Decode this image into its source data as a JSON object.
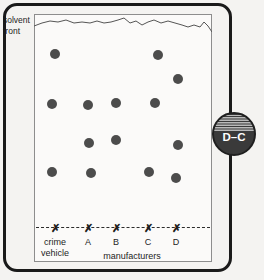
{
  "figure": {
    "background_color": "#f4f3f1",
    "frame_color": "#1a1a1a",
    "plate_fill": "#fbfaf9",
    "plate_border": "#8d8d8d",
    "spot_color": "#4c4c4c",
    "baseline_color": "#2b2b2b"
  },
  "solvent_front": {
    "label_line1": "solvent",
    "label_line2": "front",
    "path": "M 0 12 L 8 9 L 16 7 L 24 8 L 32 6 L 40 9 L 48 8 L 56 9 L 63 7 L 70 9 L 77 8 L 84 6 L 90 4 L 96 9 L 102 7 L 108 11 L 114 8 L 120 6 L 127 9 L 134 7 L 141 9 L 148 11 L 154 13 L 160 11 L 166 13 L 170 8 L 174 12 L 178 18"
  },
  "lanes": [
    {
      "id": "lane-crime-vehicle",
      "x": 55,
      "marker": "✗",
      "label_line1": "crime",
      "label_line2": "vehicle"
    },
    {
      "id": "lane-a",
      "x": 88,
      "marker": "✗",
      "label_line1": "A",
      "label_line2": ""
    },
    {
      "id": "lane-b",
      "x": 116,
      "marker": "✗",
      "label_line1": "B",
      "label_line2": ""
    },
    {
      "id": "lane-c",
      "x": 148,
      "marker": "✗",
      "label_line1": "C",
      "label_line2": ""
    },
    {
      "id": "lane-d",
      "x": 176,
      "marker": "✗",
      "label_line1": "D",
      "label_line2": ""
    }
  ],
  "group_label": "manufacturers",
  "badge": {
    "text": "D–C",
    "fill_color": "#3a3a3a",
    "stripe_color": "#d8d8d8",
    "text_color": "#ffffff"
  },
  "chart_data": {
    "type": "scatter",
    "xlabel": "manufacturers",
    "ylabel": "",
    "grid": false,
    "legend": "none",
    "axis_note": "Vertical position = distance travelled from baseline toward solvent front",
    "baseline_y": 228,
    "solvent_front_y": 26,
    "categories": [
      "crime vehicle",
      "A",
      "B",
      "C",
      "D"
    ],
    "spots": [
      {
        "lane": "crime vehicle",
        "x": 55,
        "y": 54
      },
      {
        "lane": "crime vehicle",
        "x": 52,
        "y": 104
      },
      {
        "lane": "crime vehicle",
        "x": 52,
        "y": 172
      },
      {
        "lane": "A",
        "x": 88,
        "y": 105
      },
      {
        "lane": "A",
        "x": 89,
        "y": 143
      },
      {
        "lane": "A",
        "x": 91,
        "y": 173
      },
      {
        "lane": "B",
        "x": 116,
        "y": 103
      },
      {
        "lane": "B",
        "x": 116,
        "y": 140
      },
      {
        "lane": "C",
        "x": 155,
        "y": 103
      },
      {
        "lane": "C",
        "x": 158,
        "y": 55
      },
      {
        "lane": "C",
        "x": 149,
        "y": 172
      },
      {
        "lane": "D",
        "x": 178,
        "y": 79
      },
      {
        "lane": "D",
        "x": 178,
        "y": 145
      },
      {
        "lane": "D",
        "x": 176,
        "y": 178
      }
    ]
  }
}
